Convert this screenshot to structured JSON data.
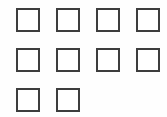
{
  "canvas": {
    "width": 167,
    "height": 117,
    "background_color": "#fefefe"
  },
  "style": {
    "box_size": 24,
    "box_border_width": 2,
    "box_border_color": "#3d3d3d",
    "box_fill_color": "#ffffff",
    "column_pitch": 40,
    "row_pitch": 40,
    "first_column_x": 16,
    "first_row_y": 8
  },
  "grid": {
    "name": "empty-checkbox-grid",
    "total_boxes": 10,
    "rows": [
      {
        "index": 0,
        "y": 8,
        "boxes": [
          {
            "index": 0,
            "x": 16,
            "checked": false,
            "mark": ""
          },
          {
            "index": 1,
            "x": 56,
            "checked": false,
            "mark": ""
          },
          {
            "index": 2,
            "x": 96,
            "checked": false,
            "mark": ""
          },
          {
            "index": 3,
            "x": 136,
            "checked": false,
            "mark": ""
          }
        ]
      },
      {
        "index": 1,
        "y": 48,
        "boxes": [
          {
            "index": 0,
            "x": 16,
            "checked": false,
            "mark": ""
          },
          {
            "index": 1,
            "x": 56,
            "checked": false,
            "mark": ""
          },
          {
            "index": 2,
            "x": 96,
            "checked": false,
            "mark": ""
          },
          {
            "index": 3,
            "x": 136,
            "checked": false,
            "mark": ""
          }
        ]
      },
      {
        "index": 2,
        "y": 88,
        "boxes": [
          {
            "index": 0,
            "x": 16,
            "checked": false,
            "mark": ""
          },
          {
            "index": 1,
            "x": 56,
            "checked": false,
            "mark": ""
          }
        ]
      }
    ]
  }
}
